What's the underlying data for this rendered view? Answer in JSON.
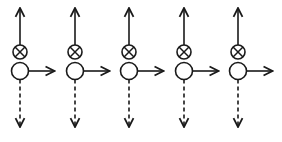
{
  "diagram": {
    "stroke_color": "#1a1a1a",
    "background": "#ffffff",
    "unit_count": 5,
    "units": [
      {
        "index": 1,
        "cx": 20
      },
      {
        "index": 2,
        "cx": 75
      },
      {
        "index": 3,
        "cx": 129
      },
      {
        "index": 4,
        "cx": 184
      },
      {
        "index": 5,
        "cx": 238
      }
    ],
    "geometry": {
      "top_arrow_tip_y": 8,
      "otimes_cy": 52,
      "otimes_r": 7,
      "circle_cy": 71,
      "circle_r": 8.5,
      "dashed_end_y": 127,
      "right_arrow_length": 26
    },
    "node_types": {
      "upper": "otimes-node",
      "lower": "open-circle-node"
    }
  }
}
